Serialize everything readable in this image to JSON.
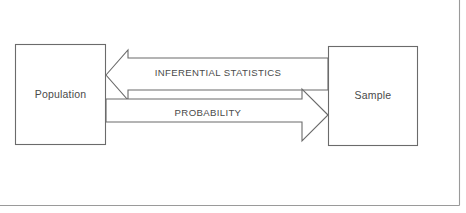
{
  "diagram": {
    "background_color": "#ffffff",
    "line_color": "#6b6b6b",
    "frame_color": "#9a9a9a",
    "text_color": "#4a4a4a",
    "nodes": [
      {
        "id": "population",
        "label": "Population"
      },
      {
        "id": "sample",
        "label": "Sample"
      }
    ],
    "edges": [
      {
        "id": "inferential-statistics",
        "label": "INFERENTIAL STATISTICS",
        "from": "sample",
        "to": "population",
        "direction": "right-to-left"
      },
      {
        "id": "probability",
        "label": "PROBABILITY",
        "from": "population",
        "to": "sample",
        "direction": "left-to-right"
      }
    ]
  }
}
